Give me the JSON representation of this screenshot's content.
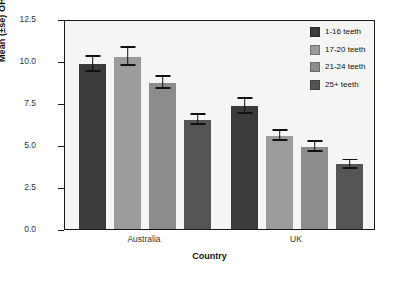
{
  "chart_data": {
    "type": "bar",
    "title": "",
    "xlabel": "Country",
    "ylabel": "Mean (±se) OHIP sum score",
    "categories": [
      "Australia",
      "UK"
    ],
    "ylim": [
      0,
      12.5
    ],
    "yticks": [
      "0.0",
      "2.5",
      "5.0",
      "7.5",
      "10.0",
      "12.5"
    ],
    "ytick_values": [
      0,
      2.5,
      5.0,
      7.5,
      10.0,
      12.5
    ],
    "grid": false,
    "legend_position": "top-right",
    "series": [
      {
        "name": "1-16 teeth",
        "color": "#3b3b3b",
        "values": [
          9.8,
          7.3
        ],
        "errors": [
          0.45,
          0.45
        ]
      },
      {
        "name": "17-20 teeth",
        "color": "#9b9b9b",
        "values": [
          10.25,
          5.55
        ],
        "errors": [
          0.55,
          0.3
        ]
      },
      {
        "name": "21-24 teeth",
        "color": "#8c8c8c",
        "values": [
          8.7,
          4.9
        ],
        "errors": [
          0.35,
          0.3
        ]
      },
      {
        "name": "25+ teeth",
        "color": "#555555",
        "values": [
          6.5,
          3.85
        ],
        "errors": [
          0.3,
          0.25
        ]
      }
    ]
  },
  "axis": {
    "y_title": "Mean (±se) OHIP sum score",
    "x_title": "Country",
    "ytick_0": "0.0",
    "ytick_1": "2.5",
    "ytick_2": "5.0",
    "ytick_3": "7.5",
    "ytick_4": "10.0",
    "ytick_5": "12.5",
    "group_0": "Australia",
    "group_1": "UK"
  },
  "legend": {
    "items": [
      {
        "label": "1-16 teeth",
        "color": "#3b3b3b"
      },
      {
        "label": "17-20 teeth",
        "color": "#9b9b9b"
      },
      {
        "label": "21-24 teeth",
        "color": "#8c8c8c"
      },
      {
        "label": "25+ teeth",
        "color": "#555555"
      }
    ]
  },
  "colors": {
    "plot_background": "#f5f5f3",
    "page_background": "#ffffff",
    "axis": "#1a1a1a",
    "text": "#111111"
  }
}
